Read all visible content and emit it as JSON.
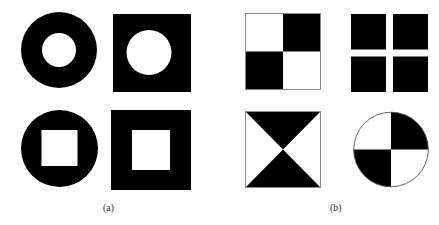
{
  "figure": {
    "background_color": "#ffffff",
    "ink_color": "#000000",
    "outline_color": "#8a8a8a",
    "panels": [
      {
        "id": "panel-a",
        "caption": "(a)",
        "caption_x": 103,
        "caption_y": 204,
        "description": "Solid shapes with a single centered hole",
        "shapes": [
          {
            "id": "annulus",
            "name": "circle-with-circular-hole",
            "type": "annulus",
            "x": 21,
            "y": 12,
            "width": 76,
            "height": 76,
            "outer_shape": "circle",
            "inner_shape": "circle",
            "inner_width": 34,
            "inner_height": 34,
            "inner_offset_x": 0,
            "inner_offset_y": 0,
            "fill": "#000000",
            "hole_fill": "#ffffff"
          },
          {
            "id": "square-circle-hole",
            "name": "square-with-circular-hole",
            "type": "square_hole",
            "x": 113,
            "y": 14,
            "width": 78,
            "height": 78,
            "outer_shape": "square",
            "inner_shape": "circle",
            "inner_width": 45,
            "inner_height": 45,
            "inner_offset_x": -3,
            "inner_offset_y": -2,
            "fill": "#000000",
            "hole_fill": "#ffffff"
          },
          {
            "id": "circle-square-hole",
            "name": "circle-with-square-hole",
            "type": "square_hole",
            "x": 21,
            "y": 110,
            "width": 77,
            "height": 77,
            "outer_shape": "circle",
            "inner_shape": "square",
            "inner_width": 36,
            "inner_height": 36,
            "inner_offset_x": 0,
            "inner_offset_y": -1,
            "fill": "#000000",
            "hole_fill": "#ffffff"
          },
          {
            "id": "square-square-hole",
            "name": "square-with-square-hole",
            "type": "square_hole",
            "x": 111,
            "y": 110,
            "width": 80,
            "height": 80,
            "outer_shape": "square",
            "inner_shape": "square",
            "inner_width": 38,
            "inner_height": 40,
            "inner_offset_x": 0,
            "inner_offset_y": -1,
            "fill": "#000000",
            "hole_fill": "#ffffff"
          }
        ]
      },
      {
        "id": "panel-b",
        "caption": "(b)",
        "caption_x": 330,
        "caption_y": 204,
        "description": "Shapes partitioned into alternating black and white regions",
        "shapes": [
          {
            "id": "checkerboard",
            "name": "checkerboard-square",
            "type": "checkerboard",
            "x": 245,
            "y": 13,
            "width": 76,
            "height": 77,
            "cells": [
              "white",
              "black",
              "black",
              "white"
            ],
            "outline": "#8a8a8a"
          },
          {
            "id": "four-squares-cross",
            "name": "four-squares-with-white-cross",
            "type": "four_squares",
            "x": 351,
            "y": 14,
            "width": 77,
            "height": 78,
            "gap": 7,
            "fill": "#000000"
          },
          {
            "id": "hourglass",
            "name": "square-with-hourglass-triangles",
            "type": "hourglass",
            "x": 245,
            "y": 111,
            "width": 76,
            "height": 77,
            "black_triangles": [
              "top",
              "bottom"
            ],
            "white_triangles": [
              "left",
              "right"
            ],
            "outline": "#8a8a8a"
          },
          {
            "id": "quadrant-circle",
            "name": "circle-with-alternating-quadrants",
            "type": "quadrant_circle",
            "x": 353,
            "y": 111,
            "width": 76,
            "height": 77,
            "quadrants": [
              "white",
              "black",
              "black",
              "white"
            ],
            "outline": "#555555"
          }
        ]
      }
    ]
  }
}
